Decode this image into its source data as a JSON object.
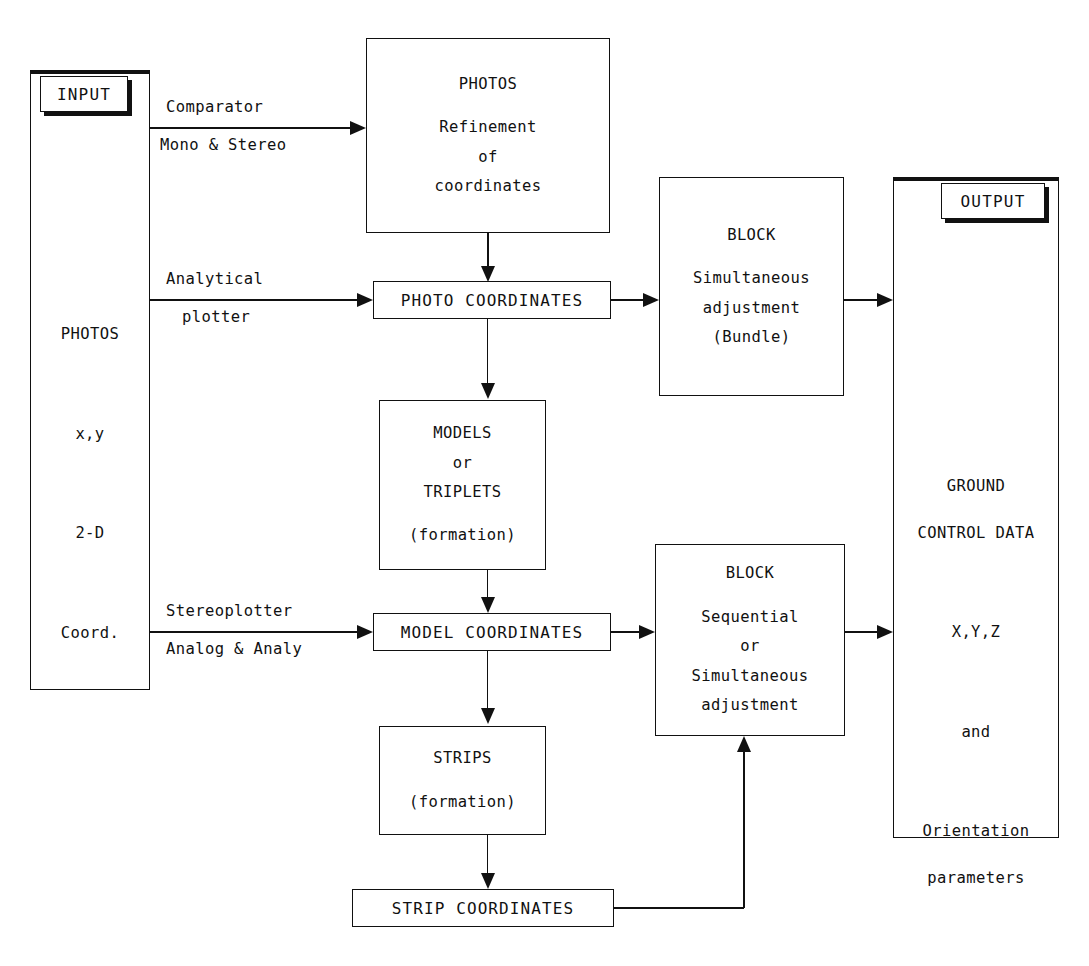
{
  "diagram": {
    "colors": {
      "ink": "#111111",
      "paper": "#ffffff"
    }
  },
  "input_column": {
    "chip_label": "INPUT",
    "lines": [
      "PHOTOS",
      "x,y",
      "2-D",
      "Coord."
    ]
  },
  "output_column": {
    "chip_label": "OUTPUT",
    "lines": [
      "GROUND",
      "CONTROL DATA",
      "X,Y,Z",
      "and",
      "Orientation",
      "parameters"
    ]
  },
  "nodes": {
    "photos_refinement": {
      "lines": [
        "PHOTOS",
        "Refinement",
        "of",
        "coordinates"
      ]
    },
    "photo_coordinates": {
      "label": "PHOTO COORDINATES"
    },
    "models_triplets": {
      "lines": [
        "MODELS",
        "or",
        "TRIPLETS",
        "(formation)"
      ]
    },
    "model_coordinates": {
      "label": "MODEL COORDINATES"
    },
    "strips": {
      "lines": [
        "STRIPS",
        "(formation)"
      ]
    },
    "strip_coordinates": {
      "label": "STRIP COORDINATES"
    },
    "block_bundle": {
      "lines": [
        "BLOCK",
        "Simultaneous",
        "adjustment",
        "(Bundle)"
      ]
    },
    "block_sequential": {
      "lines": [
        "BLOCK",
        "Sequential",
        "or",
        "Simultaneous",
        "adjustment"
      ]
    }
  },
  "edges": {
    "comparator": {
      "above": "Comparator",
      "below": "Mono & Stereo"
    },
    "analytical": {
      "above": "Analytical",
      "below": "plotter"
    },
    "stereoplotter": {
      "above": "Stereoplotter",
      "below": "Analog & Analy"
    }
  }
}
